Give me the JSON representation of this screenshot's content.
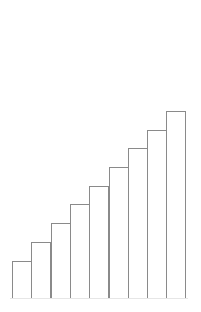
{
  "chart_data": {
    "type": "bar",
    "title": "",
    "xlabel": "",
    "ylabel": "",
    "categories": [
      "1",
      "2",
      "3",
      "4",
      "5",
      "6",
      "7",
      "8",
      "9"
    ],
    "values": [
      2,
      3,
      4,
      5,
      6,
      7,
      8,
      9,
      10
    ],
    "ylim": [
      0,
      10
    ],
    "grid": false,
    "axes_visible": false,
    "legend": null,
    "bar_fill": "#ffffff",
    "bar_edge": "#8a8a8a"
  },
  "layout": {
    "plot_left": 12,
    "plot_bottom": 298,
    "bar_width": 19.3,
    "px_per_unit": 18.7
  }
}
